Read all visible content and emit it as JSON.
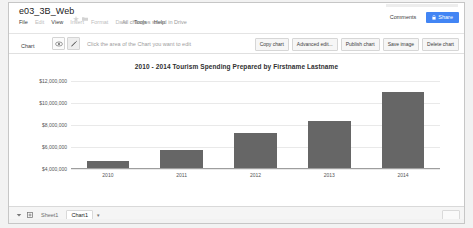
{
  "header": {
    "doc_title": "e03_3B_Web",
    "star_icon": "star-icon",
    "folder_icon": "folder-icon",
    "menu": [
      {
        "label": "File",
        "dim": false
      },
      {
        "label": "Edit",
        "dim": true
      },
      {
        "label": "View",
        "dim": false
      },
      {
        "label": "Insert",
        "dim": true
      },
      {
        "label": "Format",
        "dim": true
      },
      {
        "label": "Data",
        "dim": true
      },
      {
        "label": "Tools",
        "dim": false
      },
      {
        "label": "Help",
        "dim": false
      }
    ],
    "save_status": "All changes saved in Drive",
    "comments_label": "Comments",
    "share_label": "Share"
  },
  "edit_bar": {
    "chart_label": "Chart",
    "eye_icon": "eye-icon",
    "pencil_icon": "pencil-icon",
    "hint": "Click the area of the Chart you want to edit",
    "actions": [
      "Copy chart",
      "Advanced edit...",
      "Publish chart",
      "Save image",
      "Delete chart"
    ]
  },
  "chart_data": {
    "type": "bar",
    "title": "2010 - 2014 Tourism Spending Prepared by Firstname Lastname",
    "categories": [
      "2010",
      "2011",
      "2012",
      "2013",
      "2014"
    ],
    "values": [
      4600000,
      5600000,
      7150000,
      8300000,
      10900000
    ],
    "series": [
      {
        "name": "Tourism Spending",
        "values": [
          4600000,
          5600000,
          7150000,
          8300000,
          10900000
        ]
      }
    ],
    "ytick_labels": [
      "$12,000,000",
      "$10,000,000",
      "$8,000,000",
      "$6,000,000",
      "$4,000,000"
    ],
    "ytick_values": [
      12000000,
      10000000,
      8000000,
      6000000,
      4000000
    ],
    "ylim": [
      4000000,
      12000000
    ],
    "xlabel": "",
    "ylabel": "",
    "grid": true,
    "legend": "none",
    "bar_color": "#666666",
    "grid_color": "#e9e9e9"
  },
  "sheetbar": {
    "all_sheets_icon": "all-sheets-icon",
    "add_sheet_icon": "add-sheet-icon",
    "tabs": [
      {
        "label": "Sheet1",
        "active": false
      },
      {
        "label": "Chart1",
        "active": true
      }
    ],
    "tab_caret_icon": "chevron-down-icon"
  }
}
